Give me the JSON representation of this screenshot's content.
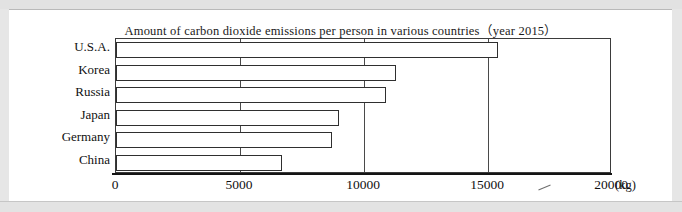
{
  "chart_data": {
    "type": "bar",
    "orientation": "horizontal",
    "title": "Amount of carbon dioxide emissions per person in various countries（year 2015）",
    "categories": [
      "U.S.A.",
      "Korea",
      "Russia",
      "Japan",
      "Germany",
      "China"
    ],
    "values": [
      15400,
      11300,
      10900,
      9000,
      8700,
      6700
    ],
    "xlabel": "",
    "ylabel": "",
    "xlim": [
      0,
      20000
    ],
    "xticks": [
      0,
      5000,
      10000,
      15000,
      20000
    ],
    "xtick_labels": [
      "0",
      "5000",
      "10000",
      "15000",
      "20000"
    ],
    "unit": "(kg)",
    "grid": true,
    "grid_axis": "x",
    "legend": null,
    "bar_fill": "#ffffff",
    "bar_edge": "#2f2f2f"
  },
  "page": {
    "background": "#ffffff",
    "scan_border_color": "#e4e4e4"
  }
}
